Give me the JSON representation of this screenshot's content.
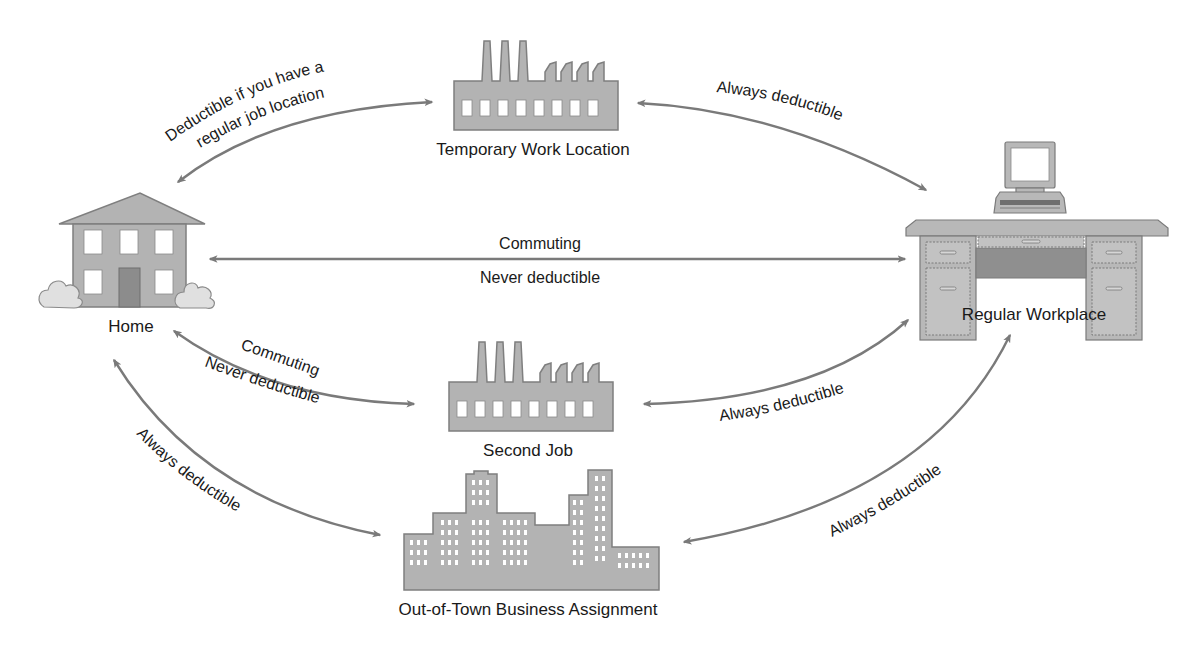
{
  "diagram": {
    "nodes": {
      "home": {
        "label": "Home"
      },
      "temporary": {
        "label": "Temporary Work Location"
      },
      "regular": {
        "label": "Regular Workplace"
      },
      "second_job": {
        "label": "Second Job"
      },
      "out_of_town": {
        "label": "Out-of-Town Business Assignment"
      }
    },
    "edges": {
      "home_temporary": {
        "line1": "Deductible if you have a",
        "line2": "regular job location"
      },
      "temporary_regular": {
        "label": "Always deductible"
      },
      "home_regular": {
        "top": "Commuting",
        "bottom": "Never deductible"
      },
      "home_second": {
        "top": "Commuting",
        "bottom": "Never deductible"
      },
      "second_regular": {
        "label": "Always deductible"
      },
      "home_outoftown": {
        "label": "Always deductible"
      },
      "outoftown_regular": {
        "label": "Always deductible"
      }
    },
    "colors": {
      "building_fill": "#b3b3b3",
      "arrow": "#7a7a7a",
      "text": "#1a1a1a",
      "background": "#ffffff"
    }
  }
}
